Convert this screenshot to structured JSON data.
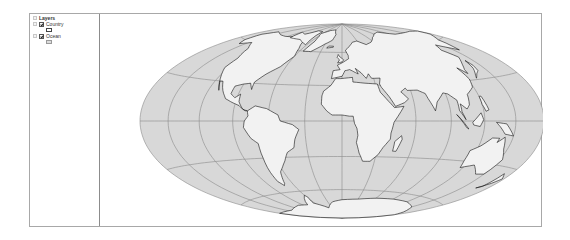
{
  "toc": {
    "root": {
      "label": "Layers",
      "icon": "layers-icon"
    },
    "layers": [
      {
        "name": "Country",
        "checked": true,
        "swatch_fill": "#ffffff",
        "swatch_stroke": "#444444"
      },
      {
        "name": "Ocean",
        "checked": true,
        "swatch_fill": "#dcdcdc",
        "swatch_stroke": "#9a9a9a"
      }
    ]
  },
  "map": {
    "projection": "Hammer",
    "ocean_color": "#d8d8d8",
    "land_color": "#f2f2f2",
    "border_color": "#111111",
    "graticule_color": "#8a8a8a",
    "graticule_interval_deg": 30,
    "center": [
      241,
      107
    ],
    "radius_x": 202,
    "radius_y": 97
  }
}
